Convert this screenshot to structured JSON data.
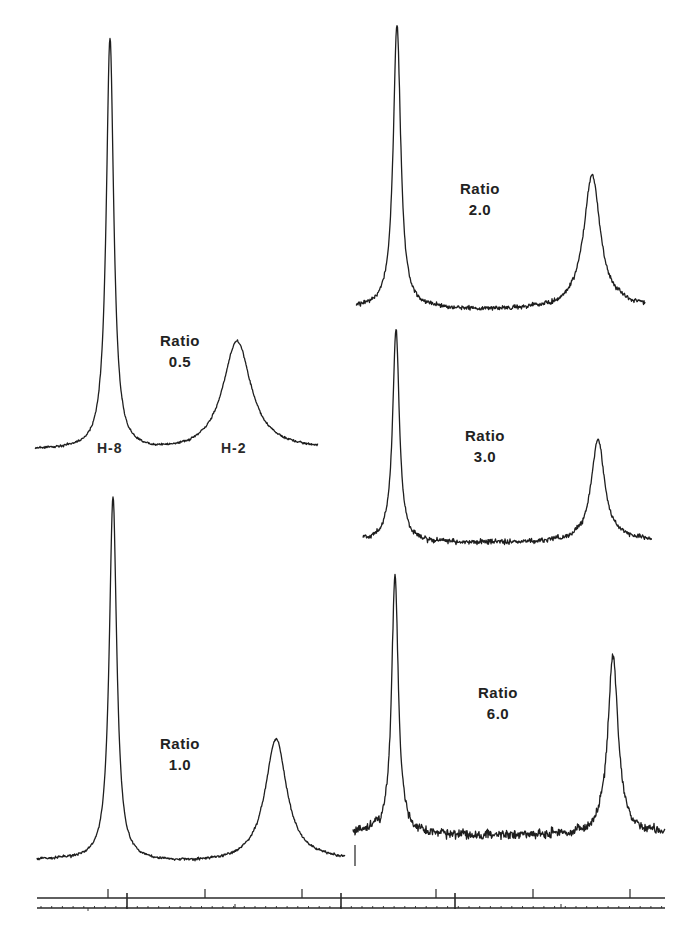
{
  "figure": {
    "peak_labels": {
      "h8": "H-8",
      "h2": "H-2"
    },
    "panels": [
      {
        "id": "r05",
        "ratio_word": "Ratio",
        "ratio_value": "0.5",
        "x0": 35,
        "x1": 318,
        "baseline": 450,
        "noise": 1.6,
        "p1": {
          "x": 110,
          "top": 38,
          "w": 4.5
        },
        "p2": {
          "x": 237,
          "top": 340,
          "w": 17
        },
        "label": {
          "x": 160,
          "y": 330
        }
      },
      {
        "id": "r20",
        "ratio_word": "Ratio",
        "ratio_value": "2.0",
        "x0": 356,
        "x1": 645,
        "baseline": 307,
        "noise": 3.2,
        "p1": {
          "x": 397,
          "top": 24,
          "w": 4.5
        },
        "p2": {
          "x": 592,
          "top": 174,
          "w": 10
        },
        "label": {
          "x": 460,
          "y": 178
        }
      },
      {
        "id": "r30",
        "ratio_word": "Ratio",
        "ratio_value": "3.0",
        "x0": 363,
        "x1": 652,
        "baseline": 540,
        "noise": 3.6,
        "p1": {
          "x": 396,
          "top": 327,
          "w": 4.0
        },
        "p2": {
          "x": 598,
          "top": 438,
          "w": 8
        },
        "label": {
          "x": 465,
          "y": 425
        }
      },
      {
        "id": "r10",
        "ratio_word": "Ratio",
        "ratio_value": "1.0",
        "x0": 37,
        "x1": 345,
        "baseline": 860,
        "noise": 1.8,
        "p1": {
          "x": 113,
          "top": 496,
          "w": 4.5
        },
        "p2": {
          "x": 276,
          "top": 738,
          "w": 13
        },
        "label": {
          "x": 160,
          "y": 733
        }
      },
      {
        "id": "r60",
        "ratio_word": "Ratio",
        "ratio_value": "6.0",
        "x0": 353,
        "x1": 665,
        "baseline": 833,
        "noise": 6.5,
        "p1": {
          "x": 395,
          "top": 575,
          "w": 4.0
        },
        "p2": {
          "x": 613,
          "top": 653,
          "w": 6
        },
        "label": {
          "x": 478,
          "y": 682
        }
      }
    ],
    "axis": {
      "upper_line": {
        "y": 898,
        "x0": 37,
        "x1": 665
      },
      "lower_line": {
        "y": 908,
        "x0": 37,
        "x1": 665
      },
      "upper_major_ticks": [
        108,
        205,
        302,
        436,
        533,
        630
      ],
      "long_ticks": [
        127,
        341,
        455
      ],
      "minor_spacing": 10.7
    }
  },
  "chart_data": {
    "type": "line",
    "title": "",
    "xlabel": "",
    "ylabel": "",
    "grid": false,
    "legend": "none",
    "peak_labels": [
      "H-8",
      "H-2"
    ],
    "series": [
      {
        "name": "Ratio 0.5",
        "h8_relative_height": 1.0,
        "h2_relative_height": 0.27,
        "h2_width_rel": "broad"
      },
      {
        "name": "Ratio 1.0",
        "h8_relative_height": 1.0,
        "h2_relative_height": 0.34,
        "h2_width_rel": "broad"
      },
      {
        "name": "Ratio 2.0",
        "h8_relative_height": 1.0,
        "h2_relative_height": 0.47,
        "h2_width_rel": "medium"
      },
      {
        "name": "Ratio 3.0",
        "h8_relative_height": 1.0,
        "h2_relative_height": 0.48,
        "h2_width_rel": "medium"
      },
      {
        "name": "Ratio 6.0",
        "h8_relative_height": 1.0,
        "h2_relative_height": 0.7,
        "h2_width_rel": "narrow"
      }
    ],
    "annotations": [
      "Ratio 0.5",
      "Ratio 1.0",
      "Ratio 2.0",
      "Ratio 3.0",
      "Ratio 6.0",
      "H-8",
      "H-2"
    ]
  }
}
